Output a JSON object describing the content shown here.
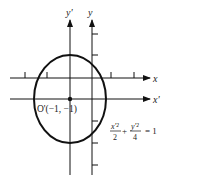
{
  "diagram": {
    "title": "",
    "axes": {
      "x_label": "x",
      "x_prime_label": "x'",
      "y_label": "y",
      "y_prime_label": "y'"
    },
    "origin_label": "O'(−1, −1)",
    "equation": {
      "num1": "x'²",
      "den1": "2",
      "plus": "+",
      "num2": "y'²",
      "den2": "4",
      "rhs": "= 1"
    },
    "ellipse": {
      "center": [
        -1,
        -1
      ],
      "a_squared": 2,
      "b_squared": 4
    },
    "colors": {
      "stroke": "#111111",
      "background": "#ffffff"
    }
  }
}
